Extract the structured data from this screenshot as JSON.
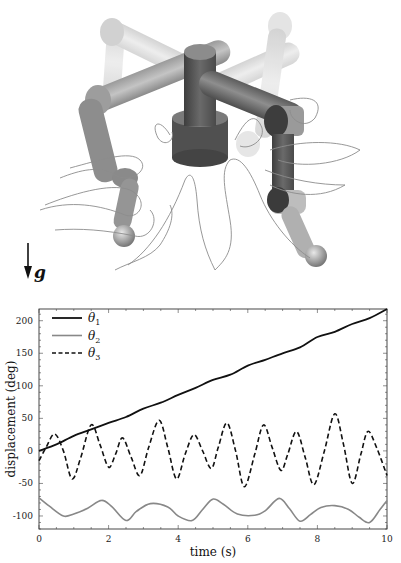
{
  "figure": {
    "illustration": {
      "description": "3D rendering of a four-legged robot with central column, with foot trajectories drawn as thin curves",
      "gravity_label": "g",
      "colors": {
        "dark_link": "#5a5a5a",
        "mid_link": "#8a8a8a",
        "ghost_link": "#c8c8c8",
        "trajectory": "#8c8c8c"
      }
    }
  },
  "chart_data": {
    "type": "line",
    "title": "",
    "xlabel": "time (s)",
    "ylabel": "displacement (deg)",
    "xlim": [
      0,
      10
    ],
    "ylim": [
      -120,
      218
    ],
    "xticks": [
      0,
      2,
      4,
      6,
      8,
      10
    ],
    "yticks": [
      -100,
      -50,
      0,
      50,
      100,
      150,
      200
    ],
    "xtick_labels": [
      "0",
      "2",
      "4",
      "6",
      "8",
      "10"
    ],
    "ytick_labels": [
      "-100",
      "-50",
      "0",
      "50",
      "100",
      "150",
      "200"
    ],
    "grid": false,
    "legend_position": "upper left",
    "series": [
      {
        "name": "θ1",
        "label_main": "θ",
        "label_sub": "1",
        "style": "solid",
        "color": "#111111",
        "width": 1.8,
        "x": [
          0,
          0.5,
          1.0,
          1.5,
          2.0,
          2.5,
          3.0,
          3.5,
          4.0,
          4.5,
          5.0,
          5.5,
          6.0,
          6.5,
          7.0,
          7.5,
          8.0,
          8.5,
          9.0,
          9.5,
          10.0
        ],
        "values": [
          0,
          10,
          23,
          33,
          43,
          52,
          65,
          74,
          86,
          97,
          109,
          117,
          131,
          140,
          150,
          159,
          175,
          183,
          195,
          204,
          218
        ]
      },
      {
        "name": "θ2",
        "label_main": "θ",
        "label_sub": "2",
        "style": "solid",
        "color": "#888888",
        "width": 1.6,
        "x": [
          0,
          0.3,
          0.7,
          1.0,
          1.4,
          1.8,
          2.1,
          2.5,
          2.8,
          3.2,
          3.7,
          4.0,
          4.4,
          4.7,
          5.0,
          5.3,
          5.7,
          6.2,
          6.5,
          6.9,
          7.2,
          7.5,
          7.8,
          8.1,
          8.5,
          8.9,
          9.2,
          9.5,
          9.8,
          10.0
        ],
        "values": [
          -72,
          -85,
          -100,
          -97,
          -88,
          -76,
          -86,
          -107,
          -93,
          -81,
          -86,
          -100,
          -107,
          -90,
          -74,
          -82,
          -97,
          -99,
          -92,
          -73,
          -89,
          -108,
          -98,
          -87,
          -84,
          -90,
          -102,
          -110,
          -90,
          -76
        ]
      },
      {
        "name": "θ3",
        "label_main": "θ",
        "label_sub": "3",
        "style": "dashed",
        "color": "#111111",
        "width": 1.6,
        "x": [
          0,
          0.2,
          0.45,
          0.7,
          0.95,
          1.2,
          1.5,
          1.75,
          2.0,
          2.2,
          2.4,
          2.65,
          2.9,
          3.15,
          3.45,
          3.7,
          3.95,
          4.2,
          4.45,
          4.7,
          4.95,
          5.15,
          5.4,
          5.65,
          5.9,
          6.2,
          6.45,
          6.7,
          6.95,
          7.15,
          7.4,
          7.65,
          7.9,
          8.2,
          8.5,
          8.75,
          9.0,
          9.25,
          9.45,
          9.7,
          10.0
        ],
        "values": [
          -15,
          5,
          26,
          0,
          -43,
          -10,
          40,
          10,
          -25,
          -5,
          20,
          -10,
          -38,
          5,
          47,
          5,
          -43,
          -5,
          25,
          0,
          -27,
          5,
          43,
          0,
          -55,
          -5,
          40,
          5,
          -30,
          -5,
          30,
          -10,
          -52,
          0,
          57,
          10,
          -50,
          -5,
          30,
          5,
          -38
        ]
      }
    ]
  }
}
